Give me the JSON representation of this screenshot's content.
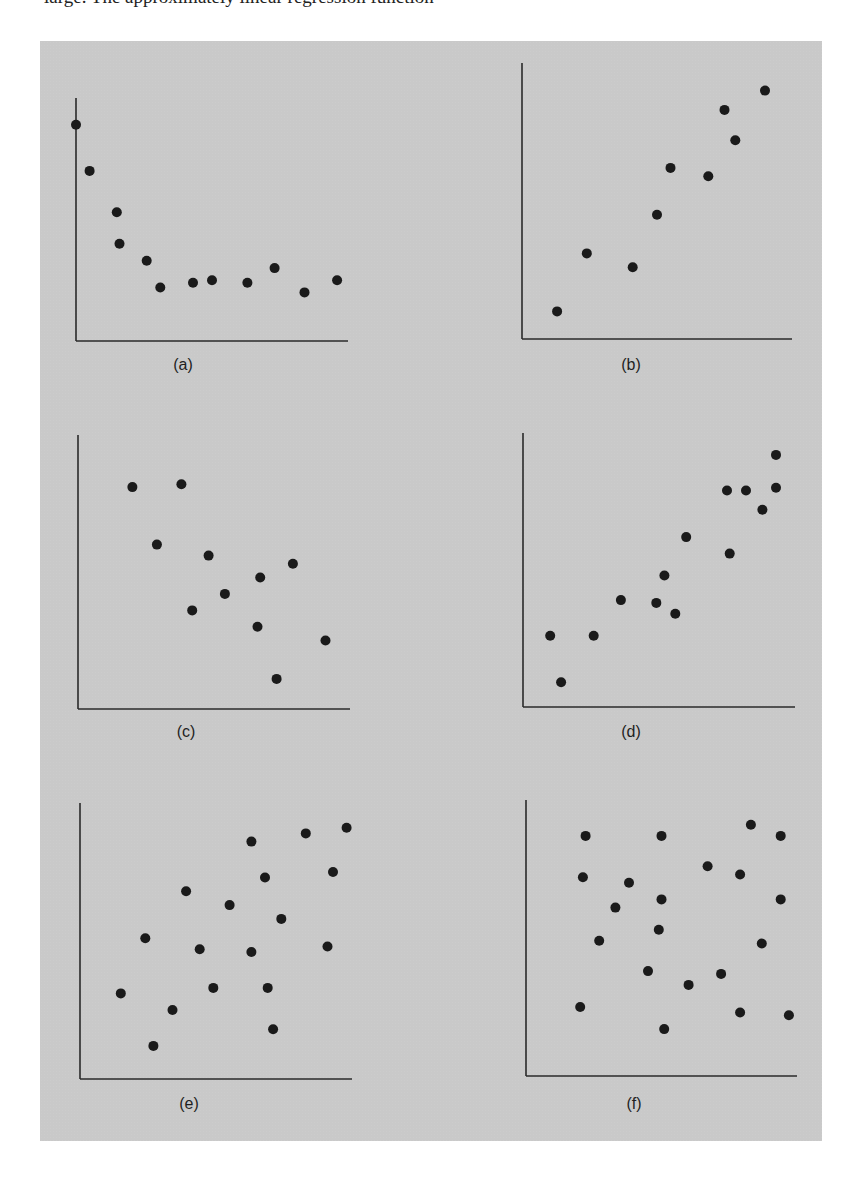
{
  "page": {
    "top_text_fragment": "large. The approximately linear regression function"
  },
  "figure": {
    "background": "#c9c9c9",
    "point_color": "#1a1a1a",
    "axis_color": "#2a2a2a"
  },
  "chart_data": [
    {
      "id": "a",
      "type": "scatter",
      "title": "",
      "label": "(a)",
      "xlabel": "",
      "ylabel": "",
      "xlim": [
        0,
        100
      ],
      "ylim": [
        0,
        100
      ],
      "grid": false,
      "legend": null,
      "pattern": "decreasing, curvilinear (levels off)",
      "x": [
        0,
        5,
        15,
        16,
        26,
        31,
        43,
        50,
        63,
        73,
        84,
        96
      ],
      "y": [
        89,
        70,
        53,
        40,
        33,
        22,
        24,
        25,
        24,
        30,
        20,
        25
      ]
    },
    {
      "id": "b",
      "type": "scatter",
      "title": "",
      "label": "(b)",
      "xlabel": "",
      "ylabel": "",
      "xlim": [
        0,
        100
      ],
      "ylim": [
        0,
        100
      ],
      "grid": false,
      "legend": null,
      "pattern": "increasing, positive linear",
      "x": [
        13,
        24,
        41,
        50,
        55,
        69,
        75,
        79,
        90
      ],
      "y": [
        10,
        31,
        26,
        45,
        62,
        59,
        83,
        72,
        90
      ]
    },
    {
      "id": "c",
      "type": "scatter",
      "title": "",
      "label": "(c)",
      "xlabel": "",
      "ylabel": "",
      "xlim": [
        0,
        100
      ],
      "ylim": [
        0,
        100
      ],
      "grid": false,
      "legend": null,
      "pattern": "weak negative linear",
      "x": [
        20,
        38,
        29,
        48,
        42,
        54,
        67,
        79,
        66,
        91,
        73
      ],
      "y": [
        81,
        82,
        60,
        56,
        36,
        42,
        48,
        53,
        30,
        25,
        11
      ]
    },
    {
      "id": "d",
      "type": "scatter",
      "title": "",
      "label": "(d)",
      "xlabel": "",
      "ylabel": "",
      "xlim": [
        0,
        100
      ],
      "ylim": [
        0,
        100
      ],
      "grid": false,
      "legend": null,
      "pattern": "strong positive linear",
      "x": [
        10,
        14,
        26,
        36,
        49,
        52,
        56,
        60,
        75,
        76,
        82,
        88,
        93,
        93
      ],
      "y": [
        26,
        9,
        26,
        39,
        38,
        48,
        34,
        62,
        79,
        56,
        79,
        72,
        80,
        92
      ]
    },
    {
      "id": "e",
      "type": "scatter",
      "title": "",
      "label": "(e)",
      "xlabel": "",
      "ylabel": "",
      "xlim": [
        0,
        100
      ],
      "ylim": [
        0,
        100
      ],
      "grid": false,
      "legend": null,
      "pattern": "weak positive, scattered",
      "x": [
        15,
        24,
        27,
        34,
        39,
        44,
        49,
        55,
        63,
        63,
        68,
        69,
        71,
        74,
        83,
        91,
        93,
        98
      ],
      "y": [
        31,
        51,
        12,
        25,
        68,
        47,
        33,
        63,
        86,
        46,
        73,
        33,
        18,
        58,
        89,
        48,
        75,
        91
      ]
    },
    {
      "id": "f",
      "type": "scatter",
      "title": "",
      "label": "(f)",
      "xlabel": "",
      "ylabel": "",
      "xlim": [
        0,
        100
      ],
      "ylim": [
        0,
        100
      ],
      "grid": false,
      "legend": null,
      "pattern": "no relationship",
      "x": [
        22,
        21,
        20,
        27,
        33,
        38,
        45,
        50,
        50,
        49,
        51,
        60,
        67,
        72,
        79,
        79,
        83,
        87,
        94,
        94,
        97
      ],
      "y": [
        87,
        72,
        25,
        49,
        61,
        70,
        38,
        87,
        64,
        53,
        17,
        33,
        76,
        37,
        23,
        73,
        91,
        48,
        87,
        64,
        22
      ]
    }
  ],
  "layout": {
    "panels": [
      {
        "id": "a",
        "origin_x": 76,
        "origin_y": 341,
        "width": 272,
        "height": 243,
        "label_x": 183,
        "label_y": 366
      },
      {
        "id": "b",
        "origin_x": 522,
        "origin_y": 339,
        "width": 270,
        "height": 276,
        "label_x": 631,
        "label_y": 366
      },
      {
        "id": "c",
        "origin_x": 78,
        "origin_y": 709,
        "width": 272,
        "height": 274,
        "label_x": 186,
        "label_y": 733
      },
      {
        "id": "d",
        "origin_x": 523,
        "origin_y": 707,
        "width": 272,
        "height": 274,
        "label_x": 631,
        "label_y": 733
      },
      {
        "id": "e",
        "origin_x": 80,
        "origin_y": 1079,
        "width": 272,
        "height": 276,
        "label_x": 189,
        "label_y": 1105
      },
      {
        "id": "f",
        "origin_x": 526,
        "origin_y": 1076,
        "width": 271,
        "height": 276,
        "label_x": 634,
        "label_y": 1105
      }
    ]
  }
}
